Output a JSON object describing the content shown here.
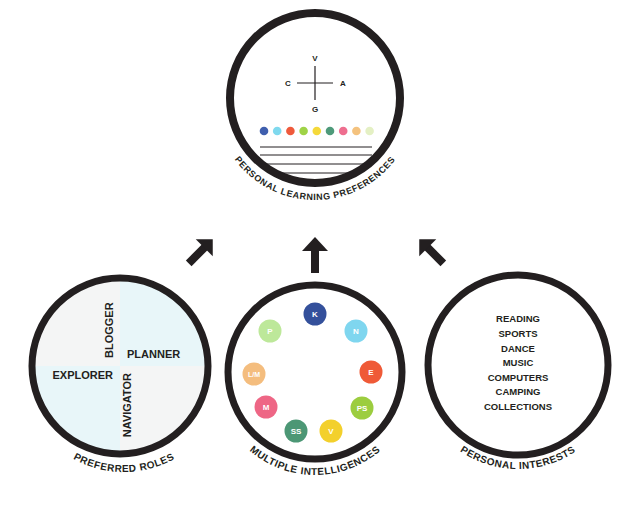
{
  "top": {
    "title": "PERSONAL LEARNING PREFERENCES",
    "axes": {
      "top": "V",
      "left": "C",
      "right": "A",
      "bottom": "G"
    },
    "dots": [
      "#3f5fae",
      "#7fd9ee",
      "#ef5a3c",
      "#9fd347",
      "#f5d93a",
      "#4e9a7a",
      "#ee6e8f",
      "#f4c27e",
      "#e4f0c4"
    ],
    "lines": 4
  },
  "arrows": [
    "up-right",
    "up",
    "up-left"
  ],
  "roles": {
    "title": "PREFERRED ROLES",
    "quadrants": {
      "top": "BLOGGER",
      "right": "PLANNER",
      "left": "EXPLORER",
      "bottom": "NAVIGATOR"
    }
  },
  "intelligences": {
    "title": "MULTIPLE INTELLIGENCES",
    "items": [
      {
        "label": "K",
        "color": "#34509b"
      },
      {
        "label": "N",
        "color": "#7fd6ef"
      },
      {
        "label": "E",
        "color": "#ef5a37"
      },
      {
        "label": "PS",
        "color": "#9ccd3f"
      },
      {
        "label": "V",
        "color": "#f3d02c"
      },
      {
        "label": "SS",
        "color": "#4c9775"
      },
      {
        "label": "M",
        "color": "#ee6685"
      },
      {
        "label": "L/M",
        "color": "#f4bd7e"
      },
      {
        "label": "P",
        "color": "#bde89a"
      }
    ]
  },
  "interests": {
    "title": "PERSONAL INTERESTS",
    "items": [
      "READING",
      "SPORTS",
      "DANCE",
      "MUSIC",
      "COMPUTERS",
      "CAMPING",
      "COLLECTIONS"
    ]
  }
}
